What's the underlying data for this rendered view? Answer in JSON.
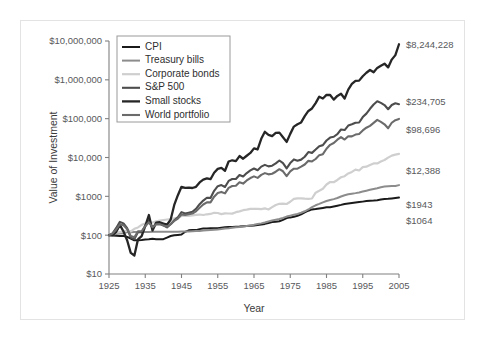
{
  "figure": {
    "border_color": "#e3e3e3",
    "background": "#ffffff"
  },
  "chart_data": {
    "type": "line",
    "title": "",
    "xlabel": "Year",
    "ylabel": "Value of Investment",
    "xlim": [
      1925,
      2005
    ],
    "ylim": [
      10,
      10000000
    ],
    "yscale": "log",
    "grid": false,
    "legend_position": "top-left",
    "x_ticks": [
      1925,
      1935,
      1945,
      1955,
      1965,
      1975,
      1985,
      1995,
      2005
    ],
    "x_tick_labels": [
      "1925",
      "1935",
      "1945",
      "1955",
      "1965",
      "1975",
      "1985",
      "1995",
      "2005"
    ],
    "y_ticks": [
      10,
      100,
      1000,
      10000,
      100000,
      1000000,
      10000000
    ],
    "y_tick_labels": [
      "$10",
      "$100",
      "$1000",
      "$10,000",
      "$100,000",
      "$1,000,000",
      "$10,000,000"
    ],
    "series": [
      {
        "name": "CPI",
        "color": "#1a1a1a",
        "width": 2.0,
        "end_label": "$1064",
        "end_value": 1064,
        "x": [
          1925,
          1926,
          1927,
          1928,
          1929,
          1930,
          1931,
          1932,
          1933,
          1934,
          1935,
          1936,
          1937,
          1938,
          1939,
          1940,
          1941,
          1942,
          1943,
          1944,
          1945,
          1946,
          1947,
          1948,
          1949,
          1950,
          1951,
          1952,
          1953,
          1954,
          1955,
          1956,
          1957,
          1958,
          1959,
          1960,
          1961,
          1962,
          1963,
          1964,
          1965,
          1966,
          1967,
          1968,
          1969,
          1970,
          1971,
          1972,
          1973,
          1974,
          1975,
          1976,
          1977,
          1978,
          1979,
          1980,
          1981,
          1982,
          1983,
          1984,
          1985,
          1986,
          1987,
          1988,
          1989,
          1990,
          1991,
          1992,
          1993,
          1994,
          1995,
          1996,
          1997,
          1998,
          1999,
          2000,
          2001,
          2002,
          2003,
          2004,
          2005
        ],
        "y": [
          100,
          98.5,
          96.5,
          95.5,
          96,
          90,
          82,
          73.5,
          74,
          75.5,
          77.8,
          78.2,
          80.6,
          79,
          78,
          78.8,
          86.5,
          95,
          99.5,
          101.5,
          103.8,
          122,
          133,
          136,
          135,
          143,
          148,
          149,
          150.5,
          150,
          150,
          154.5,
          159,
          161.5,
          163.5,
          165.5,
          166.5,
          168.5,
          171,
          173.5,
          176.5,
          182,
          187,
          195,
          206,
          217,
          223,
          229,
          248,
          275,
          287,
          297,
          317,
          342,
          385,
          427,
          460,
          471,
          486,
          503,
          520,
          526,
          549,
          574,
          602,
          637,
          655,
          673,
          694,
          712,
          731,
          754,
          770,
          781,
          798,
          826,
          849,
          863,
          883,
          907,
          932
        ]
      },
      {
        "name": "Treasury bills",
        "color": "#8c8c8c",
        "width": 2.0,
        "end_label": "$1943",
        "end_value": 1943,
        "x": [
          1925,
          1926,
          1927,
          1928,
          1929,
          1930,
          1931,
          1932,
          1933,
          1934,
          1935,
          1936,
          1937,
          1938,
          1939,
          1940,
          1941,
          1942,
          1943,
          1944,
          1945,
          1946,
          1947,
          1948,
          1949,
          1950,
          1951,
          1952,
          1953,
          1954,
          1955,
          1956,
          1957,
          1958,
          1959,
          1960,
          1961,
          1962,
          1963,
          1964,
          1965,
          1966,
          1967,
          1968,
          1969,
          1970,
          1971,
          1972,
          1973,
          1974,
          1975,
          1976,
          1977,
          1978,
          1979,
          1980,
          1981,
          1982,
          1983,
          1984,
          1985,
          1986,
          1987,
          1988,
          1989,
          1990,
          1991,
          1992,
          1993,
          1994,
          1995,
          1996,
          1997,
          1998,
          1999,
          2000,
          2001,
          2002,
          2003,
          2004,
          2005
        ],
        "y": [
          100,
          103.3,
          106.5,
          110.2,
          115.5,
          118.2,
          119.5,
          120.6,
          120.9,
          121.1,
          121.3,
          121.5,
          121.9,
          121.9,
          121.9,
          121.9,
          122.0,
          122.4,
          122.8,
          123.2,
          123.6,
          124.0,
          124.6,
          126.0,
          127.4,
          128.9,
          131.0,
          133.2,
          135.6,
          137.7,
          139.8,
          143.3,
          147.9,
          150.3,
          154.8,
          159.0,
          161.6,
          166.1,
          171.3,
          177.5,
          184.5,
          192.8,
          201.0,
          211.5,
          225.4,
          240.0,
          250.6,
          260.2,
          278.2,
          300.8,
          317.4,
          333.8,
          352.1,
          377.4,
          411.7,
          459.0,
          527.4,
          588.3,
          639.5,
          700.0,
          756.0,
          807.0,
          848.0,
          906.0,
          992.0,
          1069,
          1130,
          1172,
          1209,
          1258,
          1328,
          1396,
          1470,
          1547,
          1621,
          1717,
          1783,
          1812,
          1832,
          1855,
          1943
        ]
      },
      {
        "name": "Corporate bonds",
        "color": "#cfcfcf",
        "width": 2.2,
        "end_label": "$12,388",
        "end_value": 12388,
        "x": [
          1925,
          1926,
          1927,
          1928,
          1929,
          1930,
          1931,
          1932,
          1933,
          1934,
          1935,
          1936,
          1937,
          1938,
          1939,
          1940,
          1941,
          1942,
          1943,
          1944,
          1945,
          1946,
          1947,
          1948,
          1949,
          1950,
          1951,
          1952,
          1953,
          1954,
          1955,
          1956,
          1957,
          1958,
          1959,
          1960,
          1961,
          1962,
          1963,
          1964,
          1965,
          1966,
          1967,
          1968,
          1969,
          1970,
          1971,
          1972,
          1973,
          1974,
          1975,
          1976,
          1977,
          1978,
          1979,
          1980,
          1981,
          1982,
          1983,
          1984,
          1985,
          1986,
          1987,
          1988,
          1989,
          1990,
          1991,
          1992,
          1993,
          1994,
          1995,
          1996,
          1997,
          1998,
          1999,
          2000,
          2001,
          2002,
          2003,
          2004,
          2005
        ],
        "y": [
          100,
          107.4,
          116.3,
          119.5,
          123.4,
          133.0,
          125.0,
          146.0,
          158.0,
          184.0,
          200.0,
          216.0,
          212.0,
          227.0,
          236.0,
          245.0,
          253.0,
          261.0,
          270.0,
          282.0,
          312.0,
          315.0,
          313.0,
          322.0,
          334.0,
          340.0,
          331.0,
          345.0,
          352.0,
          377.0,
          372.0,
          348.0,
          365.0,
          361.0,
          359.0,
          391.0,
          410.0,
          440.0,
          453.0,
          475.0,
          477.0,
          475.0,
          470.0,
          490.0,
          459.0,
          527.0,
          598.0,
          643.0,
          650.0,
          634.0,
          725.0,
          863.0,
          890.0,
          888.0,
          870.0,
          860.0,
          880.0,
          1242,
          1390,
          1567,
          2020,
          2340,
          2310,
          2640,
          3100,
          3300,
          3880,
          4260,
          4860,
          4620,
          5640,
          5800,
          6450,
          7050,
          7020,
          7920,
          8600,
          9900,
          11200,
          11900,
          12388
        ]
      },
      {
        "name": "S&P 500",
        "color": "#4d4d4d",
        "width": 2.1,
        "end_label": "$234,705",
        "end_value": 234705,
        "x": [
          1925,
          1926,
          1927,
          1928,
          1929,
          1930,
          1931,
          1932,
          1933,
          1934,
          1935,
          1936,
          1937,
          1938,
          1939,
          1940,
          1941,
          1942,
          1943,
          1944,
          1945,
          1946,
          1947,
          1948,
          1949,
          1950,
          1951,
          1952,
          1953,
          1954,
          1955,
          1956,
          1957,
          1958,
          1959,
          1960,
          1961,
          1962,
          1963,
          1964,
          1965,
          1966,
          1967,
          1968,
          1969,
          1970,
          1971,
          1972,
          1973,
          1974,
          1975,
          1976,
          1977,
          1978,
          1979,
          1980,
          1981,
          1982,
          1983,
          1984,
          1985,
          1986,
          1987,
          1988,
          1989,
          1990,
          1991,
          1992,
          1993,
          1994,
          1995,
          1996,
          1997,
          1998,
          1999,
          2000,
          2001,
          2002,
          2003,
          2004,
          2005
        ],
        "y": [
          100,
          111.6,
          153.5,
          220.0,
          201.0,
          151.0,
          86.0,
          79.0,
          121.0,
          119.0,
          176.0,
          236.0,
          153.0,
          200.0,
          199.0,
          180.0,
          159.0,
          191.0,
          241.0,
          288.0,
          392.0,
          360.0,
          380.0,
          401.0,
          476.0,
          627.0,
          777.0,
          920.0,
          911.0,
          1390,
          1828,
          1948,
          1737,
          2492,
          2789,
          2803,
          3554,
          3244,
          3984,
          4640,
          5220,
          4697,
          5821,
          6463,
          5914,
          6150,
          7030,
          8363,
          7136,
          5246,
          7200,
          8920,
          8280,
          8820,
          10450,
          13840,
          13160,
          15990,
          19600,
          20830,
          27430,
          32540,
          34250,
          39940,
          52580,
          50950,
          66450,
          71500,
          78700,
          79700,
          109700,
          134900,
          179900,
          231300,
          280000,
          254500,
          224200,
          174700,
          224700,
          249200,
          234705
        ]
      },
      {
        "name": "Small stocks",
        "color": "#262626",
        "width": 2.3,
        "end_label": "$8,244,228",
        "end_value": 8244228,
        "x": [
          1925,
          1926,
          1927,
          1928,
          1929,
          1930,
          1931,
          1932,
          1933,
          1934,
          1935,
          1936,
          1937,
          1938,
          1939,
          1940,
          1941,
          1942,
          1943,
          1944,
          1945,
          1946,
          1947,
          1948,
          1949,
          1950,
          1951,
          1952,
          1953,
          1954,
          1955,
          1956,
          1957,
          1958,
          1959,
          1960,
          1961,
          1962,
          1963,
          1964,
          1965,
          1966,
          1967,
          1968,
          1969,
          1970,
          1971,
          1972,
          1973,
          1974,
          1975,
          1976,
          1977,
          1978,
          1979,
          1980,
          1981,
          1982,
          1983,
          1984,
          1985,
          1986,
          1987,
          1988,
          1989,
          1990,
          1991,
          1992,
          1993,
          1994,
          1995,
          1996,
          1997,
          1998,
          1999,
          2000,
          2001,
          2002,
          2003,
          2004,
          2005
        ],
        "y": [
          100,
          100.7,
          122.0,
          184.0,
          124.0,
          74.0,
          35.0,
          30.0,
          78.0,
          95.0,
          170.0,
          330.0,
          132.0,
          210.0,
          215.0,
          200.0,
          186.0,
          250.0,
          600.0,
          1070,
          1760,
          1660,
          1680,
          1640,
          1760,
          2280,
          2700,
          2900,
          2760,
          4060,
          5080,
          5380,
          4560,
          7880,
          8480,
          8060,
          10900,
          9300,
          11100,
          13100,
          17200,
          16100,
          30300,
          45900,
          38400,
          35600,
          43000,
          43700,
          33400,
          25200,
          40600,
          62500,
          72000,
          80000,
          116000,
          158000,
          183000,
          252000,
          368000,
          331000,
          409000,
          407000,
          310000,
          386000,
          438000,
          330000,
          561000,
          786000,
          945000,
          955000,
          1240000,
          1520000,
          1790000,
          1560000,
          2030000,
          2310000,
          2610000,
          2090000,
          3320000,
          4330000,
          8244228
        ]
      },
      {
        "name": "World portfolio",
        "color": "#6b6b6b",
        "width": 2.1,
        "end_label": "$98,696",
        "end_value": 98696,
        "x": [
          1925,
          1926,
          1927,
          1928,
          1929,
          1930,
          1931,
          1932,
          1933,
          1934,
          1935,
          1936,
          1937,
          1938,
          1939,
          1940,
          1941,
          1942,
          1943,
          1944,
          1945,
          1946,
          1947,
          1948,
          1949,
          1950,
          1951,
          1952,
          1953,
          1954,
          1955,
          1956,
          1957,
          1958,
          1959,
          1960,
          1961,
          1962,
          1963,
          1964,
          1965,
          1966,
          1967,
          1968,
          1969,
          1970,
          1971,
          1972,
          1973,
          1974,
          1975,
          1976,
          1977,
          1978,
          1979,
          1980,
          1981,
          1982,
          1983,
          1984,
          1985,
          1986,
          1987,
          1988,
          1989,
          1990,
          1991,
          1992,
          1993,
          1994,
          1995,
          1996,
          1997,
          1998,
          1999,
          2000,
          2001,
          2002,
          2003,
          2004,
          2005
        ],
        "y": [
          100,
          110.0,
          140.0,
          190.0,
          180.0,
          145.0,
          95.0,
          88.0,
          125.0,
          126.0,
          170.0,
          215.0,
          160.0,
          190.0,
          192.0,
          178.0,
          166.0,
          192.0,
          232.0,
          268.0,
          340.0,
          330.0,
          344.0,
          360.0,
          410.0,
          510.0,
          616.0,
          700.0,
          700.0,
          980.0,
          1220,
          1300,
          1190,
          1650,
          1840,
          1870,
          2300,
          2130,
          2560,
          2960,
          3260,
          2990,
          3560,
          3960,
          3680,
          3810,
          4300,
          5000,
          4420,
          3320,
          4400,
          5150,
          5160,
          5800,
          6600,
          8200,
          7900,
          9150,
          11500,
          12200,
          16800,
          21200,
          23600,
          28700,
          33500,
          29000,
          35300,
          35000,
          38900,
          40500,
          49800,
          58500,
          65400,
          77800,
          92900,
          83000,
          71500,
          56500,
          78500,
          91500,
          98696
        ]
      }
    ]
  },
  "legend": {
    "items": [
      {
        "label": "CPI"
      },
      {
        "label": "Treasury bills"
      },
      {
        "label": "Corporate bonds"
      },
      {
        "label": "S&P 500"
      },
      {
        "label": "Small stocks"
      },
      {
        "label": "World portfolio"
      }
    ]
  }
}
